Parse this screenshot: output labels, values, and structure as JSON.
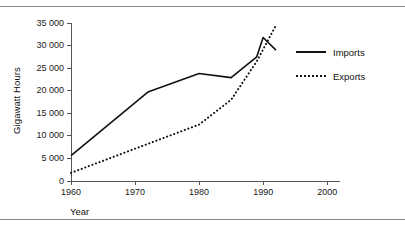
{
  "figure": {
    "rules": [
      "top-rule",
      "bottom-rule"
    ]
  },
  "chart_data": {
    "type": "line",
    "title": "",
    "xlabel": "Year",
    "ylabel": "Gigawatt Hours",
    "xlim": [
      1960,
      2002
    ],
    "ylim": [
      0,
      35000
    ],
    "xticks": [
      "1960",
      "1970",
      "1980",
      "1990",
      "2000"
    ],
    "xtick_values": [
      1960,
      1970,
      1980,
      1990,
      2000
    ],
    "yticks": [
      "0",
      "5 000",
      "10 000",
      "15 000",
      "20 000",
      "25 000",
      "30 000",
      "35 000"
    ],
    "ytick_values": [
      0,
      5000,
      10000,
      15000,
      20000,
      25000,
      30000,
      35000
    ],
    "grid": false,
    "legend_position": "right",
    "series": [
      {
        "name": "Imports",
        "style": "solid",
        "color": "#111111",
        "x": [
          1960,
          1972,
          1980,
          1985,
          1989,
          1990,
          1992
        ],
        "values": [
          5600,
          19700,
          23800,
          22900,
          27500,
          31800,
          29000
        ]
      },
      {
        "name": "Exports",
        "style": "dotted",
        "color": "#111111",
        "x": [
          1960,
          1980,
          1985,
          1989,
          1992
        ],
        "values": [
          1800,
          12500,
          18000,
          26500,
          34500
        ]
      }
    ],
    "legend": [
      "Imports",
      "Exports"
    ]
  },
  "legend": {
    "items": [
      {
        "label": "Imports",
        "swatch": "solid-line-swatch"
      },
      {
        "label": "Exports",
        "swatch": "dotted-line-swatch"
      }
    ]
  }
}
